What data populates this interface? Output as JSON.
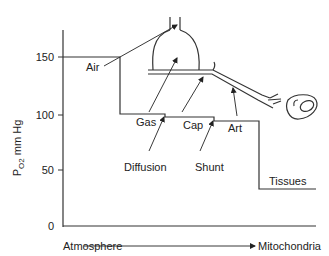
{
  "diagram": {
    "y_axis": {
      "label_main": "P",
      "label_sub": "O2",
      "label_unit": " mm Hg",
      "ticks": [
        {
          "value": "150",
          "y": 57
        },
        {
          "value": "100",
          "y": 115
        },
        {
          "value": "50",
          "y": 170
        },
        {
          "value": "0",
          "y": 226
        }
      ]
    },
    "x_axis": {
      "left_label": "Atmosphere",
      "right_label": "Mitochondria"
    },
    "stages": {
      "air": "Air",
      "gas": "Gas",
      "cap": "Cap",
      "art": "Art",
      "tissues": "Tissues",
      "diffusion": "Diffusion",
      "shunt": "Shunt"
    },
    "colors": {
      "line": "#333333",
      "text": "#222222",
      "background": "#ffffff"
    }
  }
}
